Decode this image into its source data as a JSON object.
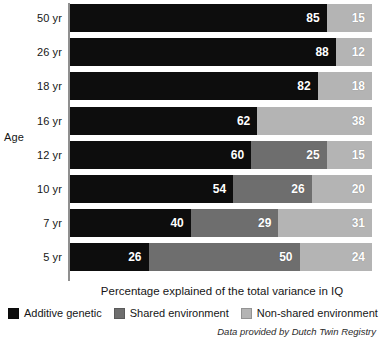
{
  "chart_data": {
    "type": "bar",
    "orientation": "horizontal",
    "stacked": true,
    "stacked_mode": "percent",
    "title": "",
    "xlabel": "Percentage explained of the total variance in IQ",
    "ylabel": "Age",
    "xlim": [
      0,
      100
    ],
    "grid": false,
    "legend_position": "bottom",
    "categories": [
      "50 yr",
      "26 yr",
      "18 yr",
      "16 yr",
      "12 yr",
      "10 yr",
      "7 yr",
      "5 yr"
    ],
    "series": [
      {
        "name": "Additive genetic",
        "color": "#0d0d0d",
        "values": [
          85,
          88,
          82,
          62,
          60,
          54,
          40,
          26
        ]
      },
      {
        "name": "Shared environment",
        "color": "#6e6e6e",
        "values": [
          0,
          0,
          0,
          0,
          25,
          26,
          29,
          50
        ]
      },
      {
        "name": "Non-shared environment",
        "color": "#b4b4b4",
        "values": [
          15,
          12,
          18,
          38,
          15,
          20,
          31,
          24
        ]
      }
    ],
    "annotations": [
      "Data provided by Dutch Twin Registry"
    ]
  },
  "axis": {
    "y_title": "Age",
    "x_caption": "Percentage explained of the total variance in IQ"
  },
  "rows": [
    {
      "label": "50 yr",
      "segments": [
        {
          "series": "additive-genetic",
          "value": 85,
          "label": "85",
          "cls": "seg-a"
        },
        {
          "series": "shared-environment",
          "value": 0,
          "label": "",
          "cls": "seg-b"
        },
        {
          "series": "non-shared-environment",
          "value": 15,
          "label": "15",
          "cls": "seg-c"
        }
      ]
    },
    {
      "label": "26 yr",
      "segments": [
        {
          "series": "additive-genetic",
          "value": 88,
          "label": "88",
          "cls": "seg-a"
        },
        {
          "series": "shared-environment",
          "value": 0,
          "label": "",
          "cls": "seg-b"
        },
        {
          "series": "non-shared-environment",
          "value": 12,
          "label": "12",
          "cls": "seg-c"
        }
      ]
    },
    {
      "label": "18 yr",
      "segments": [
        {
          "series": "additive-genetic",
          "value": 82,
          "label": "82",
          "cls": "seg-a"
        },
        {
          "series": "shared-environment",
          "value": 0,
          "label": "",
          "cls": "seg-b"
        },
        {
          "series": "non-shared-environment",
          "value": 18,
          "label": "18",
          "cls": "seg-c"
        }
      ]
    },
    {
      "label": "16 yr",
      "segments": [
        {
          "series": "additive-genetic",
          "value": 62,
          "label": "62",
          "cls": "seg-a"
        },
        {
          "series": "shared-environment",
          "value": 0,
          "label": "",
          "cls": "seg-b"
        },
        {
          "series": "non-shared-environment",
          "value": 38,
          "label": "38",
          "cls": "seg-c"
        }
      ]
    },
    {
      "label": "12 yr",
      "segments": [
        {
          "series": "additive-genetic",
          "value": 60,
          "label": "60",
          "cls": "seg-a"
        },
        {
          "series": "shared-environment",
          "value": 25,
          "label": "25",
          "cls": "seg-b"
        },
        {
          "series": "non-shared-environment",
          "value": 15,
          "label": "15",
          "cls": "seg-c"
        }
      ]
    },
    {
      "label": "10 yr",
      "segments": [
        {
          "series": "additive-genetic",
          "value": 54,
          "label": "54",
          "cls": "seg-a"
        },
        {
          "series": "shared-environment",
          "value": 26,
          "label": "26",
          "cls": "seg-b"
        },
        {
          "series": "non-shared-environment",
          "value": 20,
          "label": "20",
          "cls": "seg-c"
        }
      ]
    },
    {
      "label": "7 yr",
      "segments": [
        {
          "series": "additive-genetic",
          "value": 40,
          "label": "40",
          "cls": "seg-a"
        },
        {
          "series": "shared-environment",
          "value": 29,
          "label": "29",
          "cls": "seg-b"
        },
        {
          "series": "non-shared-environment",
          "value": 31,
          "label": "31",
          "cls": "seg-c"
        }
      ]
    },
    {
      "label": "5 yr",
      "segments": [
        {
          "series": "additive-genetic",
          "value": 26,
          "label": "26",
          "cls": "seg-a"
        },
        {
          "series": "shared-environment",
          "value": 50,
          "label": "50",
          "cls": "seg-b"
        },
        {
          "series": "non-shared-environment",
          "value": 24,
          "label": "24",
          "cls": "seg-c"
        }
      ]
    }
  ],
  "legend": [
    {
      "label": "Additive genetic",
      "color": "#0d0d0d",
      "cls": "sw-a"
    },
    {
      "label": "Shared environment",
      "color": "#6e6e6e",
      "cls": "sw-b"
    },
    {
      "label": "Non-shared environment",
      "color": "#b4b4b4",
      "cls": "sw-c"
    }
  ],
  "source_note": "Data provided by Dutch Twin Registry"
}
